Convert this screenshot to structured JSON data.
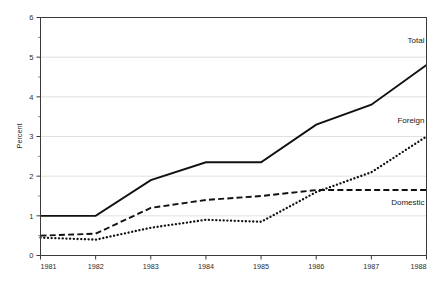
{
  "chart_data": {
    "type": "line",
    "title": "",
    "xlabel": "",
    "ylabel": "Percent",
    "categories": [
      "1981",
      "1982",
      "1983",
      "1984",
      "1985",
      "1986",
      "1987",
      "1988"
    ],
    "x": [
      1981,
      1982,
      1983,
      1984,
      1985,
      1986,
      1987,
      1988
    ],
    "xlim": [
      1981,
      1988
    ],
    "ylim": [
      0,
      6
    ],
    "yticks": [
      0,
      1,
      2,
      3,
      4,
      5,
      6
    ],
    "ytick_labels": [
      "0",
      "1",
      "2",
      "3",
      "4",
      "5",
      "6"
    ],
    "yminor_ticks": [
      0.5,
      1.5,
      2.5,
      3.5,
      4.5,
      5.5
    ],
    "xticks": [
      1981,
      1982,
      1983,
      1984,
      1985,
      1986,
      1987,
      1988
    ],
    "xtick_labels": [
      "1981",
      "1982",
      "1983",
      "1984",
      "1985",
      "1986",
      "1987",
      "1988"
    ],
    "grid": true,
    "grid_axis": "y",
    "legend_position": "inline-right",
    "series": [
      {
        "name": "Total",
        "style": "solid",
        "color": "#111111",
        "label_value": "Total",
        "values": [
          1.0,
          1.0,
          1.9,
          2.35,
          2.35,
          3.3,
          3.8,
          4.8
        ]
      },
      {
        "name": "Foreign",
        "style": "dotted",
        "color": "#111111",
        "label_value": "Foreign",
        "values": [
          0.45,
          0.4,
          0.7,
          0.9,
          0.85,
          1.6,
          2.1,
          3.0
        ]
      },
      {
        "name": "Domestic",
        "style": "dashed",
        "color": "#111111",
        "label_value": "Domestic",
        "values": [
          0.5,
          0.55,
          1.2,
          1.4,
          1.5,
          1.65,
          1.65,
          1.65
        ]
      }
    ],
    "annotations": [
      {
        "text": "Total",
        "x": 1988,
        "y": 5.35
      },
      {
        "text": "Foreign",
        "x": 1988,
        "y": 3.35
      },
      {
        "text": "Domestic",
        "x": 1988,
        "y": 1.28
      }
    ]
  }
}
